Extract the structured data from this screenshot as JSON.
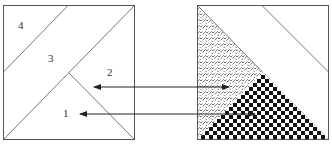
{
  "diagram": {
    "colors": {
      "stroke": "#555555",
      "arrow": "#222222",
      "hatch": "#555555",
      "checker_dark": "#111111",
      "background": "#ffffff"
    },
    "left_square": {
      "labels": [
        {
          "id": "region-4",
          "text": "4",
          "x": 18,
          "y": 20
        },
        {
          "id": "region-3",
          "text": "3",
          "x": 48,
          "y": 53
        },
        {
          "id": "region-2",
          "text": "2",
          "x": 107,
          "y": 67
        },
        {
          "id": "region-1",
          "text": "1",
          "x": 63,
          "y": 108
        }
      ]
    },
    "right_square": {
      "regions": [
        {
          "id": "hatched-triangle",
          "pattern": "zigzag-hatch"
        },
        {
          "id": "checkered-triangle",
          "pattern": "checkerboard"
        },
        {
          "id": "upper-right-strip",
          "pattern": "none"
        }
      ]
    },
    "arrows": [
      {
        "id": "arrow-2",
        "from_label": "2",
        "y": 87,
        "x1": 94,
        "x2": 229,
        "heads": "both"
      },
      {
        "id": "arrow-1",
        "from_label": "1",
        "y": 114,
        "x1": 80,
        "x2": 255,
        "heads": "both"
      }
    ]
  }
}
